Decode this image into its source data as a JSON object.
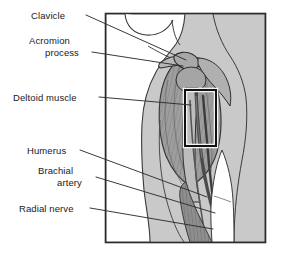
{
  "figure": {
    "kind": "anatomical-illustration",
    "title_visible": "",
    "region": "shoulder and upper arm, anterior view",
    "frame": {
      "x": 105,
      "y": 13,
      "width": 161,
      "height": 230,
      "border_color": "#2b2b2b",
      "background_color": "#c9c9c9"
    },
    "colors": {
      "background": "#ffffff",
      "panel_fill": "#c9c9c9",
      "skin_fill": "#ffffff",
      "muscle_fill": "#9a9a9a",
      "bone_fill": "#b3b3b3",
      "outline": "#3a3a3a",
      "leader_line": "#2e2e2e",
      "inset_box": "#111111",
      "inset_box_inner": "#ffffff",
      "text": "#1a1a1a"
    },
    "inset_box": {
      "x": 185,
      "y": 90,
      "width": 31,
      "height": 56
    }
  },
  "labels": [
    {
      "id": "clavicle",
      "text": "Clavicle",
      "x": 31,
      "y": 10,
      "align": "left",
      "lines": 1
    },
    {
      "id": "acromion",
      "text": "Acromion",
      "x": 29,
      "y": 35,
      "align": "left",
      "lines": 1
    },
    {
      "id": "acromion2",
      "text": "process",
      "x": 45,
      "y": 47,
      "align": "left",
      "lines": 1
    },
    {
      "id": "deltoid-muscle",
      "text": "Deltoid muscle",
      "x": 13,
      "y": 92,
      "align": "left",
      "lines": 1
    },
    {
      "id": "humerus",
      "text": "Humerus",
      "x": 27,
      "y": 145,
      "align": "left",
      "lines": 1
    },
    {
      "id": "brachial",
      "text": "Brachial",
      "x": 38,
      "y": 165,
      "align": "left",
      "lines": 1
    },
    {
      "id": "brachial2",
      "text": "artery",
      "x": 57,
      "y": 177,
      "align": "left",
      "lines": 1
    },
    {
      "id": "radial-nerve",
      "text": "Radial nerve",
      "x": 19,
      "y": 203,
      "align": "left",
      "lines": 1
    }
  ],
  "leader_lines": [
    {
      "id": "leader-clavicle",
      "from": [
        86,
        15
      ],
      "to": [
        186,
        60
      ]
    },
    {
      "id": "leader-acromion",
      "from": [
        92,
        52
      ],
      "to": [
        183,
        66
      ]
    },
    {
      "id": "leader-deltoid-muscle",
      "from": [
        99,
        97
      ],
      "to": [
        191,
        105
      ]
    },
    {
      "id": "leader-humerus",
      "from": [
        80,
        150
      ],
      "to": [
        207,
        197
      ]
    },
    {
      "id": "leader-brachial",
      "from": [
        96,
        177
      ],
      "to": [
        215,
        213
      ]
    },
    {
      "id": "leader-radial-nerve",
      "from": [
        90,
        208
      ],
      "to": [
        213,
        229
      ]
    }
  ]
}
